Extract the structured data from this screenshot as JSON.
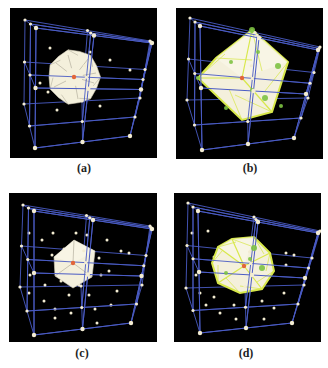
{
  "colors": {
    "background": "#000000",
    "lattice_line": "#4a5bc4",
    "lattice_node": "#f3ecd2",
    "center_node": "#e2663a",
    "polyhedron_fill": "#f4f0dc",
    "polyhedron_edge": "#a9a593",
    "highlight_green": "#7dc242",
    "highlight_yellow": "#d8e84a"
  },
  "panels": [
    {
      "id": "a",
      "caption": "(a)",
      "box": {
        "x": 10,
        "y": 8,
        "w": 147,
        "h": 150
      },
      "caption_pos": {
        "x": 54,
        "y": 161
      },
      "cube": {
        "back": [
          [
            15,
            12
          ],
          [
            140,
            33
          ],
          [
            14,
            96
          ],
          [
            130,
            90
          ]
        ],
        "front": [
          [
            26,
            20
          ],
          [
            142,
            35
          ],
          [
            25,
            140
          ],
          [
            120,
            128
          ]
        ]
      },
      "interior_points": [
        [
          40,
          40
        ],
        [
          80,
          44
        ],
        [
          100,
          52
        ],
        [
          38,
          84
        ],
        [
          47,
          102
        ],
        [
          90,
          98
        ],
        [
          30,
          75
        ],
        [
          120,
          62
        ]
      ],
      "polyhedron": {
        "type": "sphere-like",
        "cx": 64,
        "cy": 69,
        "r": 26,
        "style": "plain"
      },
      "center": [
        64,
        69
      ]
    },
    {
      "id": "b",
      "caption": "(b)",
      "box": {
        "x": 176,
        "y": 8,
        "w": 147,
        "h": 151
      },
      "caption_pos": {
        "x": 220,
        "y": 161
      },
      "cube": {
        "back": [
          [
            14,
            10
          ],
          [
            144,
            39
          ],
          [
            11,
            92
          ],
          [
            132,
            90
          ]
        ],
        "front": [
          [
            24,
            18
          ],
          [
            142,
            42
          ],
          [
            26,
            142
          ],
          [
            118,
            130
          ]
        ]
      },
      "interior_points": [],
      "polyhedron": {
        "type": "cube",
        "points": [
          [
            76,
            22
          ],
          [
            112,
            54
          ],
          [
            96,
            104
          ],
          [
            66,
            112
          ],
          [
            22,
            70
          ],
          [
            40,
            50
          ]
        ],
        "style": "highlighted"
      },
      "green_points": [
        [
          76,
          22
        ],
        [
          55,
          54
        ],
        [
          22,
          70
        ],
        [
          89,
          90
        ],
        [
          50,
          100
        ],
        [
          105,
          98
        ],
        [
          102,
          58
        ],
        [
          82,
          44
        ],
        [
          76,
          82
        ]
      ],
      "center": [
        66,
        70
      ]
    },
    {
      "id": "c",
      "caption": "(c)",
      "box": {
        "x": 9,
        "y": 193,
        "w": 148,
        "h": 149
      },
      "caption_pos": {
        "x": 52,
        "y": 346
      },
      "cube": {
        "back": [
          [
            14,
            12
          ],
          [
            141,
            33
          ],
          [
            11,
            94
          ],
          [
            133,
            92
          ]
        ],
        "front": [
          [
            25,
            18
          ],
          [
            143,
            36
          ],
          [
            25,
            142
          ],
          [
            122,
            130
          ]
        ]
      },
      "interior_points": [
        [
          20,
          40
        ],
        [
          33,
          47
        ],
        [
          44,
          40
        ],
        [
          67,
          40
        ],
        [
          78,
          42
        ],
        [
          98,
          47
        ],
        [
          21,
          82
        ],
        [
          43,
          62
        ],
        [
          36,
          92
        ],
        [
          52,
          88
        ],
        [
          70,
          92
        ],
        [
          90,
          65
        ],
        [
          100,
          78
        ],
        [
          112,
          58
        ],
        [
          120,
          60
        ],
        [
          20,
          100
        ],
        [
          35,
          108
        ],
        [
          60,
          102
        ],
        [
          80,
          102
        ],
        [
          108,
          98
        ],
        [
          46,
          116
        ],
        [
          62,
          120
        ],
        [
          86,
          116
        ],
        [
          102,
          112
        ],
        [
          46,
          125
        ],
        [
          88,
          130
        ],
        [
          55,
          56
        ],
        [
          92,
          82
        ]
      ],
      "polyhedron": {
        "type": "cube-small",
        "points": [
          [
            65,
            47
          ],
          [
            86,
            58
          ],
          [
            83,
            84
          ],
          [
            64,
            95
          ],
          [
            46,
            83
          ],
          [
            45,
            64
          ]
        ],
        "style": "plain"
      },
      "center": [
        64,
        70
      ]
    },
    {
      "id": "d",
      "caption": "(d)",
      "box": {
        "x": 174,
        "y": 193,
        "w": 147,
        "h": 149
      },
      "caption_pos": {
        "x": 216,
        "y": 346
      },
      "cube": {
        "back": [
          [
            14,
            10
          ],
          [
            146,
            38
          ],
          [
            12,
            95
          ],
          [
            130,
            92
          ]
        ],
        "front": [
          [
            24,
            18
          ],
          [
            144,
            40
          ],
          [
            26,
            140
          ],
          [
            118,
            130
          ]
        ]
      },
      "interior_points": [
        [
          18,
          40
        ],
        [
          34,
          38
        ],
        [
          22,
          82
        ],
        [
          40,
          64
        ],
        [
          26,
          100
        ],
        [
          32,
          112
        ],
        [
          60,
          112
        ],
        [
          88,
          108
        ],
        [
          110,
          100
        ],
        [
          112,
          60
        ],
        [
          120,
          62
        ],
        [
          112,
          72
        ],
        [
          46,
          120
        ],
        [
          62,
          126
        ],
        [
          90,
          126
        ],
        [
          40,
          104
        ],
        [
          100,
          115
        ]
      ],
      "polyhedron": {
        "type": "truncated",
        "points": [
          [
            58,
            46
          ],
          [
            80,
            44
          ],
          [
            96,
            60
          ],
          [
            100,
            78
          ],
          [
            88,
            96
          ],
          [
            66,
            100
          ],
          [
            44,
            90
          ],
          [
            38,
            70
          ],
          [
            44,
            54
          ]
        ],
        "style": "highlighted"
      },
      "green_points": [
        [
          80,
          55
        ],
        [
          76,
          66
        ],
        [
          52,
          80
        ],
        [
          88,
          75
        ]
      ],
      "center": [
        70,
        73
      ]
    }
  ]
}
